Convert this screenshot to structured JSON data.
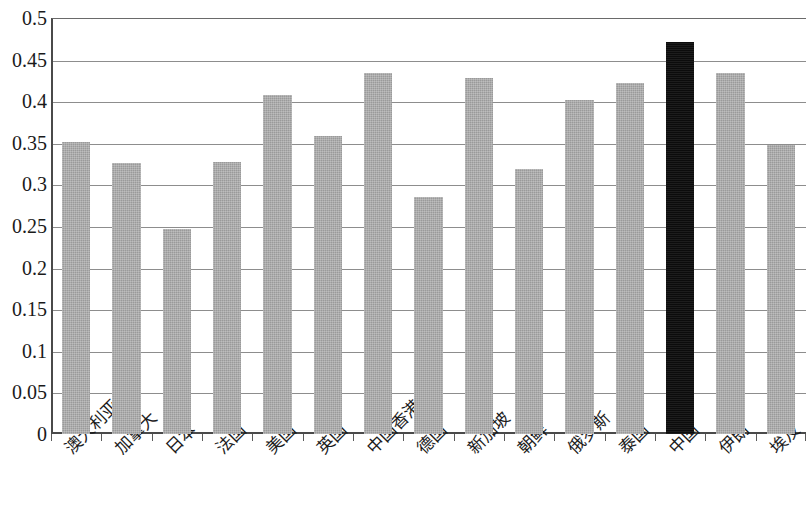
{
  "chart_data": {
    "type": "bar",
    "title": "",
    "xlabel": "",
    "ylabel": "",
    "ylim": [
      0,
      0.5
    ],
    "grid": true,
    "legend": "none",
    "categories": [
      "澳大利亚",
      "加拿大",
      "日本",
      "法国",
      "美国",
      "英国",
      "中国香港",
      "德国",
      "新加坡",
      "朝鲜",
      "俄罗斯",
      "泰国",
      "中国",
      "伊朗",
      "埃及"
    ],
    "values": [
      0.351,
      0.326,
      0.247,
      0.327,
      0.407,
      0.358,
      0.434,
      0.285,
      0.428,
      0.318,
      0.401,
      0.422,
      0.471,
      0.434,
      0.347
    ],
    "ytick_labels": [
      "0.5",
      "0.45",
      "0.4",
      "0.35",
      "0.3",
      "0.25",
      "0.2",
      "0.15",
      "0.1",
      "0.05",
      "0"
    ],
    "ytick_values": [
      0.5,
      0.45,
      0.4,
      0.35,
      0.3,
      0.25,
      0.2,
      0.15,
      0.1,
      0.05,
      0
    ],
    "highlight_index": 12,
    "colors": {
      "bar": "#9a9a9a",
      "highlight_bar": "#0c0c0c",
      "gridline": "#8d8d8d",
      "axis": "#4a4a4a",
      "text": "#1a1a1a",
      "background": "#ffffff"
    }
  }
}
